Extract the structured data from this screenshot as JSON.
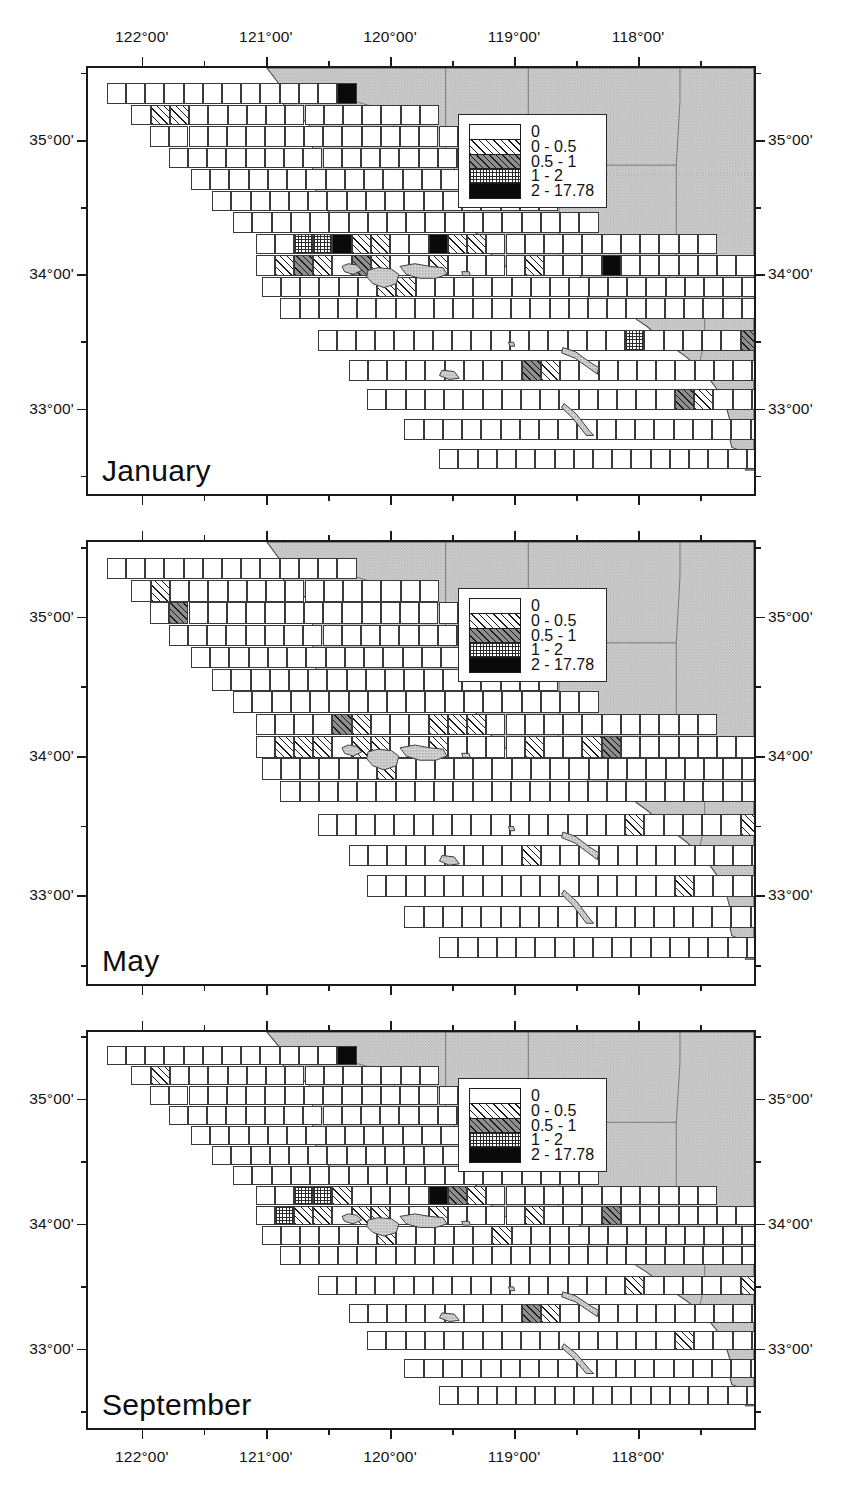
{
  "figure": {
    "type": "map-series",
    "region": "Southern California Bight",
    "panel_count": 3
  },
  "axes": {
    "longitude_ticks": [
      {
        "label": "122°00'",
        "value": -122.0
      },
      {
        "label": "121°00'",
        "value": -121.0
      },
      {
        "label": "120°00'",
        "value": -120.0
      },
      {
        "label": "119°00'",
        "value": -119.0
      },
      {
        "label": "118°00'",
        "value": -118.0
      }
    ],
    "latitude_ticks": [
      {
        "label": "35°00'",
        "value": 35.0
      },
      {
        "label": "34°00'",
        "value": 34.0
      },
      {
        "label": "33°00'",
        "value": 33.0
      }
    ],
    "lon_minor_count": 1,
    "lat_minor_count": 1,
    "lon_range": [
      -122.45,
      -117.05
    ],
    "lat_range": [
      32.35,
      35.55
    ],
    "top_axis": true,
    "bottom_axis": true,
    "left_axis": true,
    "right_axis": true
  },
  "legend": {
    "title": "",
    "entries": [
      {
        "label": "0",
        "pattern": "white",
        "class": 0,
        "min": 0,
        "max": 0
      },
      {
        "label": "0 - 0.5",
        "pattern": "sparse-hatch",
        "class": 1,
        "min": 0,
        "max": 0.5
      },
      {
        "label": "0.5 - 1",
        "pattern": "dense-gray-hatch",
        "class": 2,
        "min": 0.5,
        "max": 1
      },
      {
        "label": "1 - 2",
        "pattern": "crosshatch",
        "class": 3,
        "min": 1,
        "max": 2
      },
      {
        "label": "2 - 17.78",
        "pattern": "solid-black",
        "class": 4,
        "min": 2,
        "max": 17.78
      }
    ]
  },
  "colors": {
    "land_fill": "#c8c8c8",
    "land_stroke": "#4a4a4a",
    "frame": "#1a1a1a",
    "grid_stroke": "#3a3a3a",
    "ocean": "#ffffff",
    "text": "#111111"
  },
  "panels": [
    {
      "id": "january",
      "month_label": "January",
      "highlight_cells": [
        {
          "class": 4,
          "note": "Morro Bay"
        },
        {
          "class": 4,
          "note": "Santa Barbara Channel"
        },
        {
          "class": 4,
          "note": "Point Conception"
        },
        {
          "class": 4,
          "note": "San Diego Bay"
        },
        {
          "class": 3,
          "note": "Santa Monica Bay"
        },
        {
          "class": 2,
          "note": "Catalina"
        },
        {
          "class": 1,
          "note": "Channel Islands"
        }
      ]
    },
    {
      "id": "may",
      "month_label": "May",
      "highlight_cells": [
        {
          "class": 2,
          "note": "Point Conception"
        },
        {
          "class": 2,
          "note": "Santa Barbara Channel"
        },
        {
          "class": 1,
          "note": "Channel Islands"
        },
        {
          "class": 3,
          "note": "San Diego Bay"
        },
        {
          "class": 2,
          "note": "Catalina"
        }
      ]
    },
    {
      "id": "september",
      "month_label": "September",
      "highlight_cells": [
        {
          "class": 4,
          "note": "Morro Bay"
        },
        {
          "class": 4,
          "note": "Santa Barbara Channel"
        },
        {
          "class": 3,
          "note": "Point Conception"
        },
        {
          "class": 3,
          "note": "San Diego Bay"
        },
        {
          "class": 2,
          "note": "Catalina"
        },
        {
          "class": 1,
          "note": "Channel Islands"
        }
      ]
    }
  ],
  "chart_data": {
    "type": "heatmap",
    "title": "",
    "xlabel": "",
    "ylabel": "",
    "classes": [
      "0",
      "0 - 0.5",
      "0.5 - 1",
      "1 - 2",
      "2 - 17.78"
    ],
    "class_bounds": [
      [
        0,
        0
      ],
      [
        0,
        0.5
      ],
      [
        0.5,
        1
      ],
      [
        1,
        2
      ],
      [
        2,
        17.78
      ]
    ],
    "panels": [
      "January",
      "May",
      "September"
    ],
    "xlim": [
      -122.45,
      -117.05
    ],
    "ylim": [
      32.35,
      35.55
    ],
    "grid": true,
    "legend_position": "upper-right"
  }
}
